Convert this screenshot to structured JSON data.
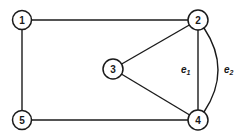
{
  "diagram": {
    "type": "undirected-graph",
    "nodes": [
      {
        "id": "1",
        "label": "1",
        "x": 22,
        "y": 20
      },
      {
        "id": "2",
        "label": "2",
        "x": 198,
        "y": 20
      },
      {
        "id": "3",
        "label": "3",
        "x": 113,
        "y": 69
      },
      {
        "id": "4",
        "label": "4",
        "x": 198,
        "y": 120
      },
      {
        "id": "5",
        "label": "5",
        "x": 22,
        "y": 120
      }
    ],
    "edges": [
      {
        "from": "1",
        "to": "2",
        "label": ""
      },
      {
        "from": "1",
        "to": "5",
        "label": ""
      },
      {
        "from": "5",
        "to": "4",
        "label": ""
      },
      {
        "from": "3",
        "to": "2",
        "label": ""
      },
      {
        "from": "3",
        "to": "4",
        "label": ""
      },
      {
        "from": "2",
        "to": "4",
        "label": "e1",
        "style": "straight"
      },
      {
        "from": "2",
        "to": "4",
        "label": "e2",
        "style": "curved"
      }
    ],
    "edge_labels": {
      "e1": {
        "base": "e",
        "sub": "1"
      },
      "e2": {
        "base": "e",
        "sub": "2"
      }
    },
    "colors": {
      "stroke": "#1a1a1a",
      "background": "#ffffff"
    }
  }
}
